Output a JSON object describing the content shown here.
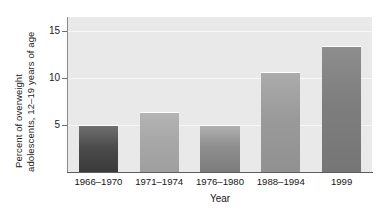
{
  "chart_data": {
    "type": "bar",
    "title": "",
    "subtitle": "",
    "xlabel": "Year",
    "ylabel": "Percent of overweight adolescents, 12–19 years of age",
    "ylabel_lines": [
      "Percent of overweight",
      "adolescents, 12–19 years of age"
    ],
    "categories": [
      "1966–1970",
      "1971–1974",
      "1976–1980",
      "1988–1994",
      "1999"
    ],
    "values": [
      5.0,
      6.4,
      5.0,
      10.7,
      13.4
    ],
    "ytick_labels": [
      "15",
      "10",
      "5"
    ],
    "ytick_values": [
      15,
      10,
      5
    ],
    "ylim": [
      0,
      16.5
    ],
    "xlim_note": "categorical",
    "grid": "horizontal gridlines at 5, 10, 15",
    "legend": "none",
    "bar_colors": [
      "#4c4c4c",
      "#a8a8a8",
      "#8e8e8e",
      "#9a9a9a",
      "#7e7e7e"
    ],
    "bar_colors_top": [
      "#6f6f6f",
      "#b4b4b4",
      "#b0b0b0",
      "#ababab",
      "#8d8d8d"
    ],
    "bar_colors_bottom": [
      "#3a3a3a",
      "#9f9f9f",
      "#7c7c7c",
      "#919191",
      "#767676"
    ],
    "plot_background": "#e9e9e9",
    "gridline_color": "#f7f7f7",
    "axis_color": "#5e5e5e",
    "text_color": "#161616"
  }
}
